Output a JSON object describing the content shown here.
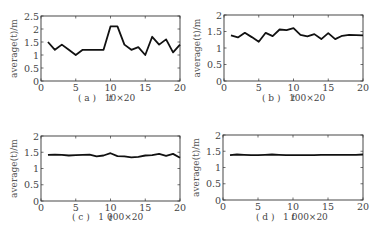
{
  "figure": {
    "panels": [
      {
        "id": "a",
        "caption": "( a )   10×20"
      },
      {
        "id": "b",
        "caption": "( b )   100×20"
      },
      {
        "id": "c",
        "caption": "( c )   1 000×20"
      },
      {
        "id": "d",
        "caption": "( d )   1 000×20"
      }
    ]
  },
  "chart_data": [
    {
      "type": "line",
      "title": "(a) 10×20",
      "xlabel": "t",
      "ylabel": "average(t)/m",
      "xlim": [
        0,
        20
      ],
      "ylim": [
        0,
        2.5
      ],
      "xticks": [
        0,
        5,
        10,
        15,
        20
      ],
      "yticks": [
        0,
        0.5,
        1,
        1.5,
        2,
        2.5
      ],
      "ytick_labels": [
        "0",
        "0.5",
        "1",
        "1.5",
        "2",
        "2.5"
      ],
      "grid": false,
      "x": [
        1,
        2,
        3,
        4,
        5,
        6,
        7,
        8,
        9,
        10,
        11,
        12,
        13,
        14,
        15,
        16,
        17,
        18,
        19,
        20
      ],
      "series": [
        {
          "name": "10×20",
          "values": [
            1.5,
            1.2,
            1.4,
            1.2,
            1.0,
            1.2,
            1.2,
            1.2,
            1.2,
            2.1,
            2.1,
            1.4,
            1.2,
            1.3,
            1.0,
            1.7,
            1.4,
            1.6,
            1.1,
            1.4
          ]
        }
      ]
    },
    {
      "type": "line",
      "title": "(b) 100×20",
      "xlabel": "t",
      "ylabel": "average(t)/m",
      "xlim": [
        0,
        20
      ],
      "ylim": [
        0,
        2
      ],
      "xticks": [
        0,
        5,
        10,
        15,
        20
      ],
      "yticks": [
        0,
        0.5,
        1,
        1.5,
        2
      ],
      "ytick_labels": [
        "0",
        "0.5",
        "1",
        "1.5",
        "2"
      ],
      "grid": false,
      "x": [
        1,
        2,
        3,
        4,
        5,
        6,
        7,
        8,
        9,
        10,
        11,
        12,
        13,
        14,
        15,
        16,
        17,
        18,
        19,
        20
      ],
      "series": [
        {
          "name": "100×20",
          "values": [
            1.38,
            1.32,
            1.46,
            1.33,
            1.19,
            1.46,
            1.36,
            1.56,
            1.54,
            1.6,
            1.4,
            1.35,
            1.42,
            1.27,
            1.45,
            1.27,
            1.37,
            1.4,
            1.39,
            1.38
          ]
        }
      ]
    },
    {
      "type": "line",
      "title": "(c) 1 000×20",
      "xlabel": "t",
      "ylabel": "average(t)/m",
      "xlim": [
        0,
        20
      ],
      "ylim": [
        0,
        2
      ],
      "xticks": [
        0,
        5,
        10,
        15,
        20
      ],
      "yticks": [
        0,
        0.5,
        1,
        1.5,
        2
      ],
      "ytick_labels": [
        "0",
        "0.5",
        "1",
        "1.5",
        "2"
      ],
      "grid": false,
      "x": [
        1,
        2,
        3,
        4,
        5,
        6,
        7,
        8,
        9,
        10,
        11,
        12,
        13,
        14,
        15,
        16,
        17,
        18,
        19,
        20
      ],
      "series": [
        {
          "name": "1 000×20",
          "values": [
            1.42,
            1.43,
            1.42,
            1.4,
            1.41,
            1.42,
            1.43,
            1.37,
            1.4,
            1.47,
            1.38,
            1.37,
            1.34,
            1.36,
            1.4,
            1.41,
            1.45,
            1.39,
            1.45,
            1.33
          ]
        }
      ]
    },
    {
      "type": "line",
      "title": "(d) 1 000×20",
      "xlabel": "t",
      "ylabel": "average(t)/m",
      "xlim": [
        0,
        20
      ],
      "ylim": [
        0,
        2
      ],
      "xticks": [
        0,
        5,
        10,
        15,
        20
      ],
      "yticks": [
        0,
        0.5,
        1,
        1.5,
        2
      ],
      "ytick_labels": [
        "0",
        "0.5",
        "1",
        "1.5",
        "2"
      ],
      "grid": false,
      "x": [
        1,
        2,
        3,
        4,
        5,
        6,
        7,
        8,
        9,
        10,
        11,
        12,
        13,
        14,
        15,
        16,
        17,
        18,
        19,
        20
      ],
      "series": [
        {
          "name": "1 000×20",
          "values": [
            1.38,
            1.4,
            1.39,
            1.38,
            1.38,
            1.39,
            1.4,
            1.39,
            1.38,
            1.38,
            1.38,
            1.38,
            1.38,
            1.39,
            1.39,
            1.39,
            1.39,
            1.39,
            1.39,
            1.4
          ]
        }
      ]
    }
  ],
  "layout": {
    "plots": [
      {
        "left": 41,
        "right": 180,
        "top": 16,
        "bottom": 81
      },
      {
        "left": 224,
        "right": 363,
        "top": 15,
        "bottom": 81
      },
      {
        "left": 41,
        "right": 180,
        "top": 136,
        "bottom": 201
      },
      {
        "left": 223,
        "right": 363,
        "top": 135,
        "bottom": 200
      }
    ],
    "captions": [
      {
        "x": 78,
        "y": 93
      },
      {
        "x": 262,
        "y": 93
      },
      {
        "x": 72,
        "y": 212
      },
      {
        "x": 256,
        "y": 212
      }
    ]
  }
}
